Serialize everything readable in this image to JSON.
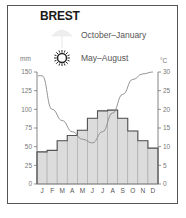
{
  "title": "BREST",
  "legend": [
    {
      "icon": "rain-umbrella-icon",
      "label": "October–January"
    },
    {
      "icon": "sun-icon",
      "label": "May–August"
    }
  ],
  "left_unit": "mm",
  "right_unit": "°C",
  "colors": {
    "bar_fill": "#dcdcdc",
    "bar_stroke": "#555555",
    "line": "#888888",
    "axis": "#666666",
    "frame": "#555555"
  },
  "chart_data": {
    "type": "bar",
    "title": "BREST",
    "categories": [
      "J",
      "F",
      "M",
      "A",
      "M",
      "J",
      "J",
      "A",
      "S",
      "O",
      "N",
      "D"
    ],
    "series": [
      {
        "name": "bars (left axis, mm)",
        "type": "bar",
        "values": [
          43,
          45,
          58,
          65,
          72,
          88,
          98,
          99,
          88,
          71,
          58,
          48
        ]
      },
      {
        "name": "line (right axis, °C)",
        "type": "line",
        "values": [
          29,
          20,
          17,
          14,
          12,
          11,
          14,
          19,
          24,
          28,
          29.5,
          30
        ]
      }
    ],
    "xlabel": "",
    "ylabel_left": "mm",
    "ylabel_right": "°C",
    "ylim_left": [
      0,
      150
    ],
    "ylim_right": [
      0,
      30
    ],
    "yticks_left": [
      0,
      25,
      50,
      75,
      100,
      125,
      150
    ],
    "yticks_right": [
      0,
      5,
      10,
      15,
      20,
      25,
      30
    ],
    "legend": [
      "October–January",
      "May–August"
    ],
    "grid": false
  }
}
